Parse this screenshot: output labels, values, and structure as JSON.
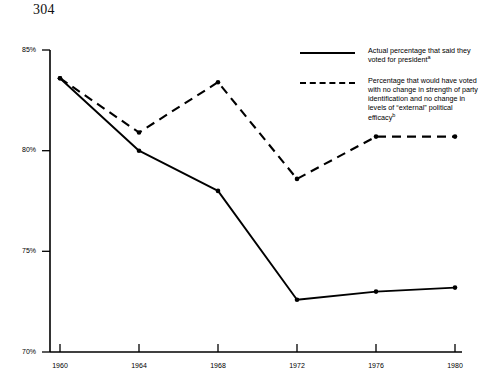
{
  "page": {
    "number": "304"
  },
  "legend": {
    "position": "top-right",
    "entries": [
      {
        "style": "solid",
        "text": "Actual percentage that said they voted for president",
        "note": "a"
      },
      {
        "style": "dashed",
        "text": "Percentage that would have voted with no change in strength of party identification and no change in levels of “external” political efficacy",
        "note": "b"
      }
    ]
  },
  "chart_data": {
    "type": "line",
    "title": "",
    "subtitle": "",
    "xlabel": "",
    "ylabel": "",
    "categories": [
      "1960",
      "1964",
      "1968",
      "1972",
      "1976",
      "1980"
    ],
    "x": [
      1960,
      1964,
      1968,
      1972,
      1976,
      1980
    ],
    "xlim": [
      1960,
      1980
    ],
    "ylim": [
      70,
      85
    ],
    "yticks": [
      70,
      75,
      80,
      85
    ],
    "ytick_labels": [
      "70%",
      "75%",
      "80%",
      "85%"
    ],
    "xtick_labels": [
      "1960",
      "1964",
      "1968",
      "1972",
      "1976",
      "1980"
    ],
    "grid": false,
    "legend_position": "top-right",
    "series": [
      {
        "name": "Actual percentage that said they voted for president",
        "style": "solid",
        "marker": "dot",
        "color": "#000000",
        "values": [
          83.6,
          80.0,
          78.0,
          72.6,
          73.0,
          73.2
        ]
      },
      {
        "name": "Percentage that would have voted with no change in strength of party identification and no change in levels of “external” political efficacy",
        "style": "dashed",
        "marker": "dot",
        "color": "#000000",
        "values": [
          83.6,
          80.9,
          83.4,
          78.6,
          80.7,
          80.7
        ]
      }
    ]
  }
}
